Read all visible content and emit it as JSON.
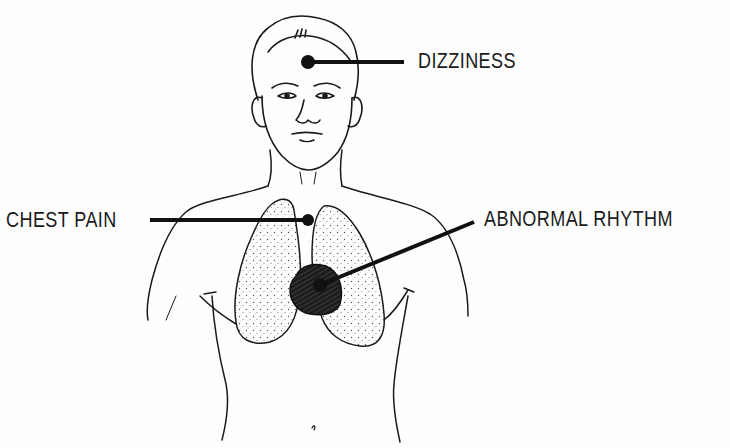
{
  "diagram": {
    "type": "anatomical-illustration",
    "colors": {
      "ink": "#1a1a1a",
      "background": "#fefefe",
      "lung_stipple": "#6a6a6a",
      "heart_fill": "#222222"
    },
    "callouts": [
      {
        "id": "dizziness",
        "label": "DIZZINESS",
        "target": "forehead"
      },
      {
        "id": "chest-pain",
        "label": "CHEST PAIN",
        "target": "center of chest between lungs"
      },
      {
        "id": "abnormal-rhythm",
        "label": "ABNORMAL RHYTHM",
        "target": "heart"
      }
    ]
  }
}
